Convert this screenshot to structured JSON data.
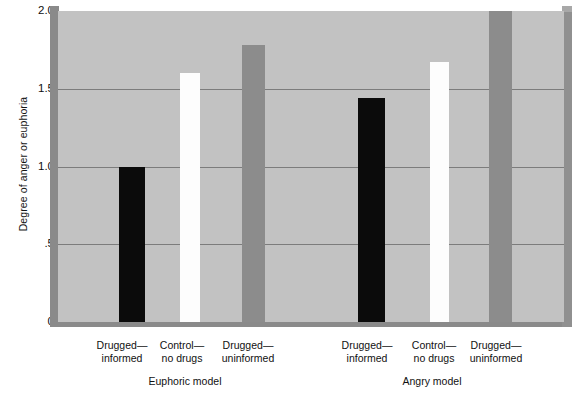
{
  "chart_data": {
    "type": "bar",
    "title": "",
    "subtitle": "",
    "xlabel": "",
    "ylabel": "Degree of anger or euphoria",
    "ylim": [
      0,
      2.0
    ],
    "yticks": [
      "0",
      ".5",
      "1.0",
      "1.5",
      "2.0"
    ],
    "ytick_values": [
      0,
      0.5,
      1.0,
      1.5,
      2.0
    ],
    "grid": "horizontal",
    "legend": "none",
    "groups": [
      "Euphoric model",
      "Angry model"
    ],
    "categories": [
      "Drugged—informed",
      "Control—no drugs",
      "Drugged—uninformed"
    ],
    "category_lines": [
      [
        "Drugged—",
        "informed"
      ],
      [
        "Control—",
        "no drugs"
      ],
      [
        "Drugged—",
        "uninformed"
      ]
    ],
    "series": [
      {
        "name": "Euphoric model",
        "values": [
          1.0,
          1.6,
          1.78
        ]
      },
      {
        "name": "Angry model",
        "values": [
          1.44,
          1.67,
          2.0
        ]
      }
    ],
    "bar_colors": [
      "#0b0b0b",
      "#fdfdfd",
      "#8c8c8c"
    ],
    "background_color": "#c2c2c2",
    "frame_color": "#8a8a8a",
    "gridline_color": "#7c7c7c"
  },
  "axis": {
    "y_title": "Degree of anger or euphoria",
    "ticks": [
      {
        "label": "2.0",
        "value": 2.0
      },
      {
        "label": "1.5",
        "value": 1.5
      },
      {
        "label": "1.0",
        "value": 1.0
      },
      {
        "label": ".5",
        "value": 0.5
      },
      {
        "label": "0",
        "value": 0.0
      }
    ]
  },
  "bars": [
    {
      "group": "Euphoric model",
      "category": "Drugged—informed",
      "value": 1.0,
      "color": "#0b0b0b",
      "style": "black"
    },
    {
      "group": "Euphoric model",
      "category": "Control—no drugs",
      "value": 1.6,
      "color": "#fdfdfd",
      "style": "white"
    },
    {
      "group": "Euphoric model",
      "category": "Drugged—uninformed",
      "value": 1.78,
      "color": "#8c8c8c",
      "style": "gray"
    },
    {
      "group": "Angry model",
      "category": "Drugged—informed",
      "value": 1.44,
      "color": "#0b0b0b",
      "style": "black"
    },
    {
      "group": "Angry model",
      "category": "Control—no drugs",
      "value": 1.67,
      "color": "#fdfdfd",
      "style": "white"
    },
    {
      "group": "Angry model",
      "category": "Drugged—uninformed",
      "value": 2.0,
      "color": "#8c8c8c",
      "style": "gray"
    }
  ],
  "category_labels": [
    {
      "line1": "Drugged—",
      "line2": "informed"
    },
    {
      "line1": "Control—",
      "line2": "no drugs"
    },
    {
      "line1": "Drugged—",
      "line2": "uninformed"
    },
    {
      "line1": "Drugged—",
      "line2": "informed"
    },
    {
      "line1": "Control—",
      "line2": "no drugs"
    },
    {
      "line1": "Drugged—",
      "line2": "uninformed"
    }
  ],
  "group_labels": [
    {
      "text": "Euphoric model"
    },
    {
      "text": "Angry model"
    }
  ]
}
